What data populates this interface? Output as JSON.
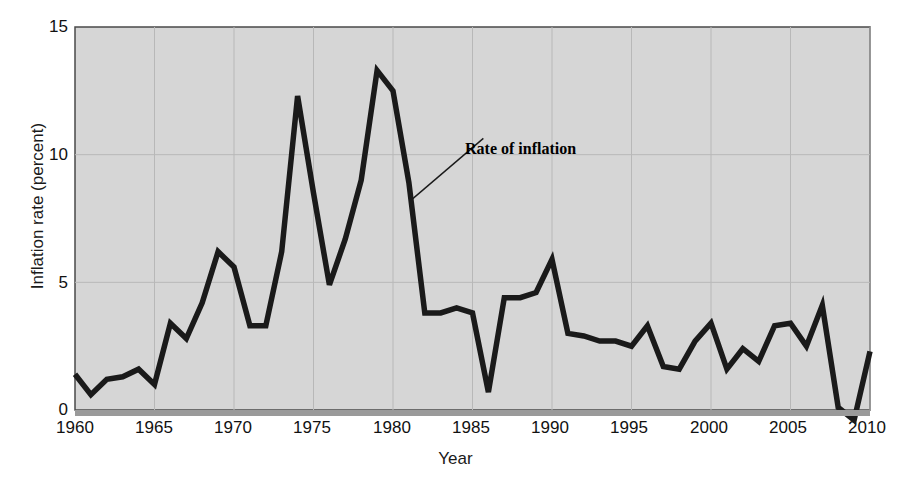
{
  "chart_data": {
    "type": "line",
    "title": "",
    "xlabel": "Year",
    "ylabel": "Inflation rate (percent)",
    "xlim": [
      1960,
      2010
    ],
    "ylim": [
      0,
      15
    ],
    "yticks": [
      "0",
      "5",
      "10",
      "15"
    ],
    "ytick_values": [
      0,
      5,
      10,
      15
    ],
    "xticks": [
      "1960",
      "1965",
      "1970",
      "1975",
      "1980",
      "1985",
      "1990",
      "1995",
      "2000",
      "2005",
      "2010"
    ],
    "xtick_values": [
      1960,
      1965,
      1970,
      1975,
      1980,
      1985,
      1990,
      1995,
      2000,
      2005,
      2010
    ],
    "grid": true,
    "legend": "none",
    "series": [
      {
        "name": "Rate of inflation",
        "color": "#1a1a1a",
        "x": [
          1960,
          1961,
          1962,
          1963,
          1964,
          1965,
          1966,
          1967,
          1968,
          1969,
          1970,
          1971,
          1972,
          1973,
          1974,
          1975,
          1976,
          1977,
          1978,
          1979,
          1980,
          1981,
          1982,
          1983,
          1984,
          1985,
          1986,
          1987,
          1988,
          1989,
          1990,
          1991,
          1992,
          1993,
          1994,
          1995,
          1996,
          1997,
          1998,
          1999,
          2000,
          2001,
          2002,
          2003,
          2004,
          2005,
          2006,
          2007,
          2008,
          2009,
          2010
        ],
        "values": [
          1.4,
          0.6,
          1.2,
          1.3,
          1.6,
          1.0,
          3.4,
          2.8,
          4.2,
          6.2,
          5.6,
          3.3,
          3.3,
          6.2,
          12.3,
          8.5,
          4.9,
          6.7,
          9.0,
          13.3,
          12.5,
          8.9,
          3.8,
          3.8,
          4.0,
          3.8,
          0.7,
          4.4,
          4.4,
          4.6,
          5.9,
          3.0,
          2.9,
          2.7,
          2.7,
          2.5,
          3.3,
          1.7,
          1.6,
          2.7,
          3.4,
          1.6,
          2.4,
          1.9,
          3.3,
          3.4,
          2.5,
          4.1,
          0.1,
          -0.4,
          2.3
        ]
      }
    ],
    "annotations": [
      {
        "text": "Rate of inflation",
        "label_x": 1986.5,
        "label_y": 10.6,
        "point_x": 1981.1,
        "point_y": 8.2
      }
    ]
  },
  "style": {
    "plot_background": "#d6d6d6",
    "grid_color": "#b8b8b8",
    "line_color": "#1a1a1a",
    "axis_color": "#4a4a4a",
    "text_color": "#111111"
  }
}
